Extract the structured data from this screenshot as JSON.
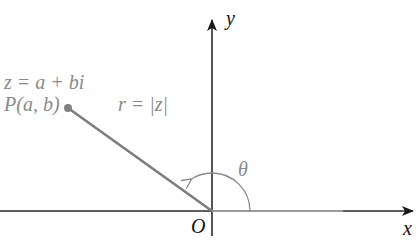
{
  "diagram": {
    "axes": {
      "x_label": "x",
      "y_label": "y",
      "origin_label": "O"
    },
    "point": {
      "equation_label": "z = a + bi",
      "point_label": "P(a, b)"
    },
    "modulus_label": "r = |z|",
    "angle_label": "θ",
    "colors": {
      "axis": "#2a2a2a",
      "vector": "#8a8a8a",
      "label_gray": "#8a8a8a",
      "label_dark": "#111111"
    }
  }
}
